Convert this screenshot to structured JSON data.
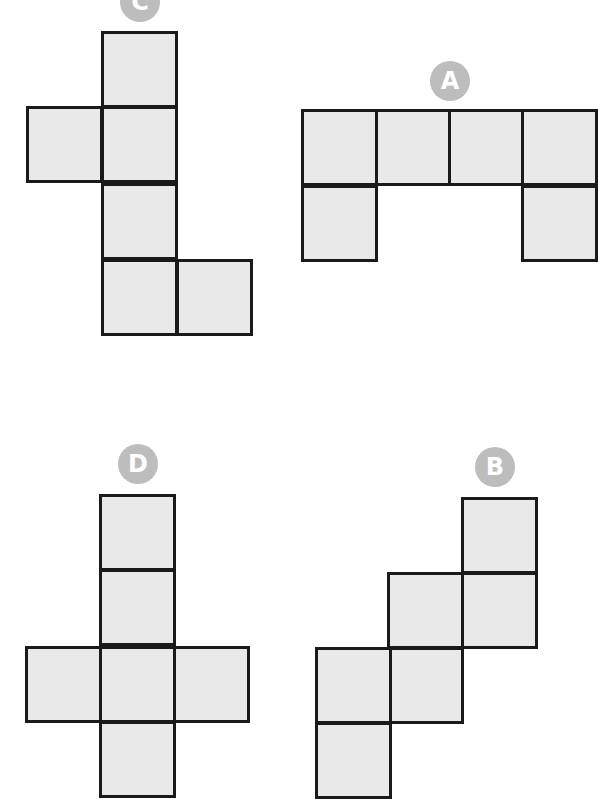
{
  "diagram": {
    "cell_size": 75,
    "colors": {
      "fill": "#e9e9e9",
      "border": "#1a1a1a",
      "badge": "#bdbdbd",
      "badge_text": "#ffffff"
    },
    "nets": [
      {
        "label": "C",
        "badge": {
          "x": 120,
          "y": -18
        },
        "cells": [
          [
            101,
            31
          ],
          [
            101,
            106
          ],
          [
            26,
            106
          ],
          [
            101,
            183
          ],
          [
            101,
            259
          ],
          [
            176,
            259
          ]
        ]
      },
      {
        "label": "A",
        "badge": {
          "x": 430,
          "y": 61
        },
        "cells": [
          [
            301,
            109
          ],
          [
            375,
            109
          ],
          [
            448,
            109
          ],
          [
            521,
            109
          ],
          [
            301,
            185
          ],
          [
            521,
            185
          ]
        ]
      },
      {
        "label": "D",
        "badge": {
          "x": 118,
          "y": 444
        },
        "cells": [
          [
            99,
            494
          ],
          [
            99,
            569
          ],
          [
            25,
            646
          ],
          [
            99,
            646
          ],
          [
            173,
            646
          ],
          [
            99,
            721
          ]
        ]
      },
      {
        "label": "B",
        "badge": {
          "x": 475,
          "y": 447
        },
        "cells": [
          [
            461,
            497
          ],
          [
            461,
            572
          ],
          [
            387,
            572
          ],
          [
            387,
            647
          ],
          [
            315,
            647
          ],
          [
            315,
            722
          ]
        ]
      }
    ]
  }
}
